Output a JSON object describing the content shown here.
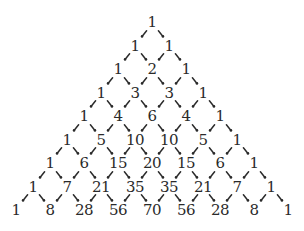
{
  "diagram": {
    "rows": [
      [
        1
      ],
      [
        1,
        1
      ],
      [
        1,
        2,
        1
      ],
      [
        1,
        3,
        3,
        1
      ],
      [
        1,
        4,
        6,
        4,
        1
      ],
      [
        1,
        5,
        10,
        10,
        5,
        1
      ],
      [
        1,
        6,
        15,
        20,
        15,
        6,
        1
      ],
      [
        1,
        7,
        21,
        35,
        35,
        21,
        7,
        1
      ],
      [
        1,
        8,
        28,
        56,
        70,
        56,
        28,
        8,
        1
      ]
    ],
    "arrow_style": "dashed-diagonal-arrows",
    "colors": {
      "text": "#2a2a2a",
      "arrow": "#2a2a2a",
      "background": "#ffffff"
    }
  }
}
